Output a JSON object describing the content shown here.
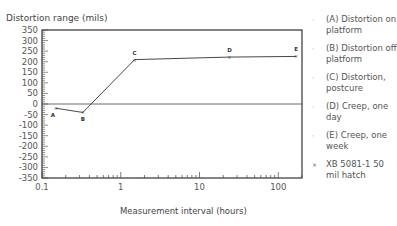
{
  "chart_data": {
    "type": "line",
    "title": "",
    "ylabel": "Distortion range (mils)",
    "xlabel": "Measurement interval (hours)",
    "xscale": "log",
    "xlim": [
      0.1,
      200
    ],
    "ylim": [
      -350,
      350
    ],
    "yticks": [
      350,
      300,
      250,
      200,
      150,
      100,
      50,
      0,
      -50,
      -100,
      -150,
      -200,
      -250,
      -300,
      -350
    ],
    "xticks": [
      "0.1",
      "1",
      "10",
      "100"
    ],
    "grid": false,
    "legend_position": "right",
    "series": [
      {
        "name": "XB 5081-1 50 mil hatch",
        "points": [
          {
            "label": "A",
            "x": 0.15,
            "y": -20
          },
          {
            "label": "B",
            "x": 0.33,
            "y": -40
          },
          {
            "label": "C",
            "x": 1.5,
            "y": 210
          },
          {
            "label": "D",
            "x": 24,
            "y": 222
          },
          {
            "label": "E",
            "x": 168,
            "y": 225
          }
        ]
      }
    ],
    "legend": [
      {
        "marker": "·",
        "text": "(A) Distortion on platform"
      },
      {
        "marker": "·",
        "text": "(B) Distortion off platform"
      },
      {
        "marker": "·",
        "text": "(C) Distortion, postcure"
      },
      {
        "marker": "·",
        "text": "(D) Creep, one day"
      },
      {
        "marker": "·",
        "text": "(E) Creep, one week"
      },
      {
        "marker": "×",
        "text": "XB 5081-1 50 mil hatch"
      }
    ]
  },
  "labels": {
    "ylabel": "Distortion range (mils)",
    "xlabel": "Measurement interval (hours)"
  }
}
